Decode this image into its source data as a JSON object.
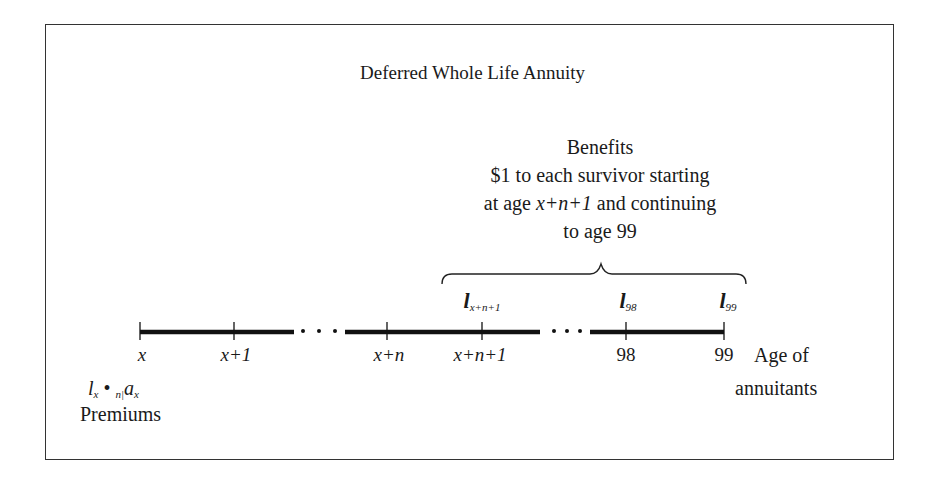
{
  "diagram": {
    "title": "Deferred Whole Life Annuity",
    "benefits": {
      "heading": "Benefits",
      "line1": "$1 to each survivor starting",
      "line2_pre": "at age ",
      "line2_expr": "x+n+1",
      "line2_post": " and continuing",
      "line3": "to age 99"
    },
    "timeline": {
      "ticks": [
        {
          "label": "x",
          "x": 140
        },
        {
          "label": "x+1",
          "x": 234
        },
        {
          "label": "x+n",
          "x": 387
        },
        {
          "label": "x+n+1",
          "x": 482
        },
        {
          "label": "98",
          "x": 626
        },
        {
          "label": "99",
          "x": 724
        }
      ],
      "ellipsis": "· · ·",
      "survivors": [
        {
          "symbol": "l",
          "subscript": "x+n+1",
          "x": 482
        },
        {
          "symbol": "l",
          "subscript": "98",
          "x": 626
        },
        {
          "symbol": "l",
          "subscript": "99",
          "x": 724
        }
      ],
      "axis_label_line1": "Age of",
      "axis_label_line2": "annuitants"
    },
    "premiums": {
      "formula_l": "l",
      "formula_l_sub": "x",
      "formula_dot": " • ",
      "formula_pre_sub": "n|",
      "formula_a": "a",
      "formula_a_sub": "x",
      "label": "Premiums"
    }
  }
}
